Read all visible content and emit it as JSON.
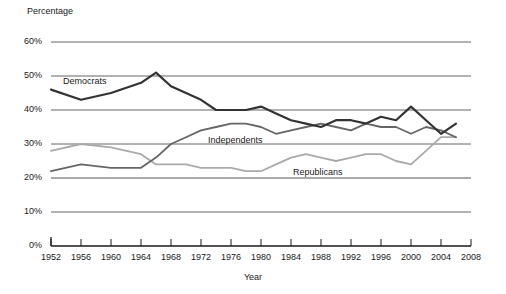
{
  "chart_data": {
    "type": "line",
    "title": "",
    "xlabel": "Year",
    "ylabel": "Percentage",
    "xlim": [
      1952,
      2008
    ],
    "ylim": [
      0,
      60
    ],
    "grid": true,
    "legend_position": "inline-labels",
    "x_ticks": [
      1952,
      1956,
      1960,
      1964,
      1968,
      1972,
      1976,
      1980,
      1984,
      1988,
      1992,
      1996,
      2000,
      2004,
      2008
    ],
    "x_tick_labels": [
      "1952",
      "1956",
      "1960",
      "1964",
      "1968",
      "1972",
      "1976",
      "1980",
      "1984",
      "1988",
      "1992",
      "1996",
      "2000",
      "2004",
      "2008"
    ],
    "y_ticks": [
      0,
      10,
      20,
      30,
      40,
      50,
      60
    ],
    "y_tick_labels": [
      "0%",
      "10%",
      "20%",
      "30%",
      "40%",
      "50%",
      "60%"
    ],
    "x": [
      1952,
      1956,
      1960,
      1964,
      1966,
      1968,
      1970,
      1972,
      1974,
      1976,
      1978,
      1980,
      1982,
      1984,
      1986,
      1988,
      1990,
      1992,
      1994,
      1996,
      1998,
      2000,
      2002,
      2004,
      2006
    ],
    "series": [
      {
        "name": "Democrats",
        "color": "#333333",
        "width": 2.2,
        "values": [
          46,
          43,
          45,
          48,
          51,
          47,
          45,
          43,
          40,
          40,
          40,
          41,
          39,
          37,
          36,
          35,
          37,
          37,
          36,
          38,
          37,
          41,
          37,
          33,
          36
        ]
      },
      {
        "name": "Independents",
        "color": "#666666",
        "width": 1.8,
        "values": [
          22,
          24,
          23,
          23,
          26,
          30,
          32,
          34,
          35,
          36,
          36,
          35,
          33,
          34,
          35,
          36,
          35,
          34,
          36,
          35,
          35,
          33,
          35,
          34,
          32
        ]
      },
      {
        "name": "Republicans",
        "color": "#aaaaaa",
        "width": 1.8,
        "values": [
          28,
          30,
          29,
          27,
          24,
          24,
          24,
          23,
          23,
          23,
          22,
          22,
          24,
          26,
          27,
          26,
          25,
          26,
          27,
          27,
          25,
          24,
          28,
          32,
          32
        ]
      }
    ],
    "annotations": [
      {
        "text": "Democrats",
        "series": "Democrats"
      },
      {
        "text": "Independents",
        "series": "Independents"
      },
      {
        "text": "Republicans",
        "series": "Republicans"
      }
    ],
    "axis_color": "#1a1a1a",
    "gridline_color": "#555555"
  }
}
